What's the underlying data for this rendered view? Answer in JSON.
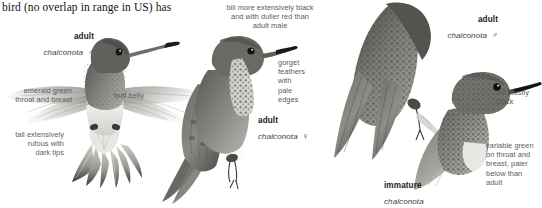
{
  "page": {
    "background_color": "#ffffff",
    "running_text": "bird (no overlap in range in US) has"
  },
  "figures": [
    {
      "id": "adult-male-hovering",
      "age": "adult",
      "scientific_name": "chalconota",
      "sex_symbol": "♂",
      "view": "hovering front view, wings spread"
    },
    {
      "id": "adult-female-perched",
      "age": "adult",
      "scientific_name": "chalconota",
      "sex_symbol": "♀",
      "view": "perched side view facing right"
    },
    {
      "id": "adult-male-back",
      "age": "adult",
      "scientific_name": "chalconota",
      "sex_symbol": "♂",
      "view": "perched back view"
    },
    {
      "id": "immature-perched",
      "age": "immature",
      "scientific_name": "chalconota",
      "sex_symbol": "",
      "view": "head and breast, facing right"
    }
  ],
  "annotations": {
    "emerald_green": "emerald green\nthroat and breast",
    "buff_belly": "buff belly",
    "tail_rufous": "tail extensively\nrufous with\ndark tips",
    "bill_black_duller": "bill more extensively black\nand with duller red than\nadult male",
    "gorget_edges": "gorget\nfeathers\nwith\npale\nedges",
    "bill_mostly_black": "bill mostly\nblack",
    "variable_green": "variable green\non throat and\nbreast, paler\nbelow than\nadult"
  },
  "colors": {
    "text_dark": "#1a1a1a",
    "annotation_gray": "#5b5b5b",
    "plumage_dark": "#4a4a48",
    "plumage_mid": "#7d7d79",
    "plumage_light": "#b9b9b4",
    "belly_pale": "#ececea",
    "bill_black": "#2b2b2b"
  }
}
